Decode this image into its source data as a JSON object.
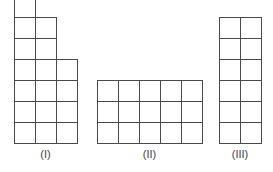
{
  "cell_size": 21,
  "line_color": "#4a4a4a",
  "figures": [
    {
      "label": "(I)",
      "left": 14,
      "bottom": 143,
      "column_heights": [
        7,
        6,
        4
      ]
    },
    {
      "label": "(II)",
      "left": 97,
      "bottom": 143,
      "column_heights": [
        3,
        3,
        3,
        3,
        3
      ]
    },
    {
      "label": "(III)",
      "left": 219,
      "bottom": 143,
      "column_heights": [
        6,
        6
      ]
    }
  ]
}
